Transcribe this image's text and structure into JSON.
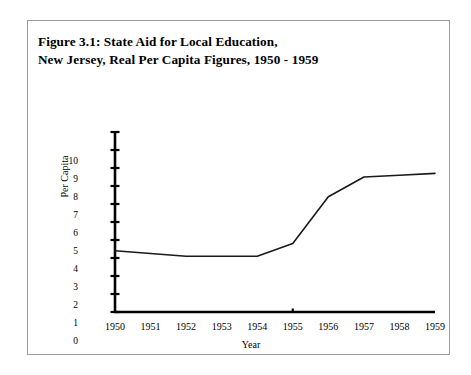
{
  "figure": {
    "title_line_1": "Figure 3.1: State Aid for Local Education,",
    "title_line_2": "New Jersey, Real Per Capita Figures, 1950 - 1959"
  },
  "chart_data": {
    "type": "line",
    "title": "Figure 3.1: State Aid for Local Education, New Jersey, Real Per Capita Figures, 1950 - 1959",
    "xlabel": "Year",
    "ylabel": "Per Capita",
    "categories": [
      "1950",
      "1951",
      "1952",
      "1953",
      "1954",
      "1955",
      "1956",
      "1957",
      "1958",
      "1959"
    ],
    "x": [
      1950,
      1951,
      1952,
      1953,
      1954,
      1955,
      1956,
      1957,
      1958,
      1959
    ],
    "values": [
      3.4,
      3.25,
      3.1,
      3.1,
      3.1,
      3.8,
      6.4,
      7.5,
      7.6,
      7.7
    ],
    "series": [
      {
        "name": "Real per capita state aid",
        "values": [
          3.4,
          3.25,
          3.1,
          3.1,
          3.1,
          3.8,
          6.4,
          7.5,
          7.6,
          7.7
        ]
      }
    ],
    "xlim": [
      1950,
      1959
    ],
    "ylim": [
      0,
      10
    ],
    "ytick_labels": [
      "10",
      "9",
      "8",
      "7",
      "6",
      "5",
      "4",
      "3",
      "2",
      "1",
      "0"
    ],
    "ytick_values": [
      10,
      9,
      8,
      7,
      6,
      5,
      4,
      3,
      2,
      1,
      0
    ],
    "ytick_step": 1,
    "grid": false,
    "legend": false,
    "legend_position": "none",
    "line_color": "#1a1a1a",
    "axis_color": "#000000",
    "background_color": "#ffffff"
  }
}
